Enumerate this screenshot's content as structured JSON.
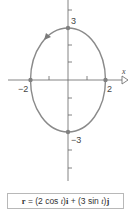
{
  "diagram": {
    "type": "parametric-ellipse",
    "axes": {
      "x_label": "x",
      "x_ticks": [
        "-2",
        "2"
      ],
      "y_ticks": [
        "3",
        "-3"
      ]
    },
    "points": [
      {
        "label": "3",
        "x": 0,
        "y": 3
      },
      {
        "label": "-2",
        "x": -2,
        "y": 0
      },
      {
        "label": "2",
        "x": 2,
        "y": 0
      },
      {
        "label": "-3",
        "x": 0,
        "y": -3
      }
    ],
    "direction": "counterclockwise",
    "colors": {
      "curve": "#8a8a8a",
      "axis": "#666666",
      "point": "#808080"
    }
  },
  "labels": {
    "y_top": "3",
    "y_bottom": "−3",
    "x_left": "−2",
    "x_right": "2",
    "x_axis": "x"
  },
  "equation": {
    "r": "r",
    "eq": " = (2 cos ",
    "t1": "t",
    "mid1": ")",
    "i": "i",
    "plus": " + (3 sin ",
    "t2": "t",
    "mid2": ")",
    "j": "j"
  }
}
